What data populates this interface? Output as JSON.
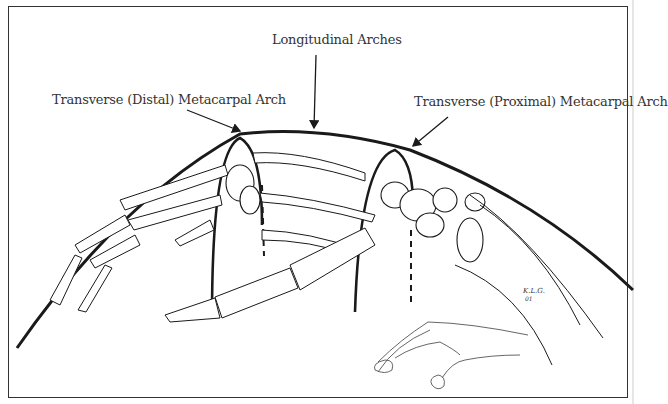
{
  "figure": {
    "labels": {
      "longitudinal": "Longitudinal Arches",
      "distal": "Transverse (Distal) Metacarpal Arch",
      "proximal": "Transverse (Proximal) Metacarpal Arch"
    },
    "signature": "K.L.G. 01",
    "colors": {
      "ink": "#1a1a1a",
      "border": "#333333",
      "background": "#ffffff"
    }
  }
}
